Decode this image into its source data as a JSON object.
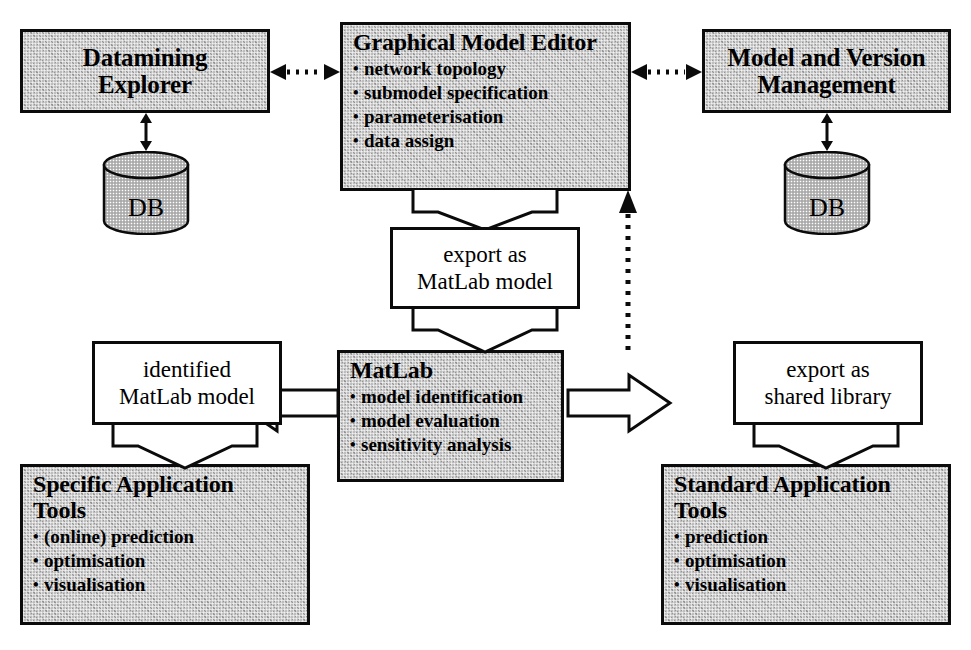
{
  "diagram": {
    "colors": {
      "box_fill": "#bdbdbd",
      "box_border": "#0b0b0b",
      "label_fill": "#ffffff",
      "canvas": "#ffffff"
    },
    "nodes": {
      "datamining_explorer": {
        "title_line1": "Datamining",
        "title_line2": "Explorer"
      },
      "graphical_model_editor": {
        "title": "Graphical Model Editor",
        "bullets": [
          "network topology",
          "submodel specification",
          "parameterisation",
          "data assign"
        ]
      },
      "model_and_version_management": {
        "title_line1": "Model and Version",
        "title_line2": "Management"
      },
      "db_left": {
        "label": "DB"
      },
      "db_right": {
        "label": "DB"
      },
      "export_matlab": {
        "line1": "export as",
        "line2": "MatLab model"
      },
      "matlab": {
        "title": "MatLab",
        "bullets": [
          "model identification",
          "model evaluation",
          "sensitivity analysis"
        ]
      },
      "identified_matlab_model": {
        "line1": "identified",
        "line2": "MatLab model"
      },
      "export_shared_library": {
        "line1": "export as",
        "line2": "shared library"
      },
      "specific_application_tools": {
        "title_line1": "Specific Application",
        "title_line2": "Tools",
        "bullets": [
          "(online) prediction",
          "optimisation",
          "visualisation"
        ]
      },
      "standard_application_tools": {
        "title_line1": "Standard Application",
        "title_line2": "Tools",
        "bullets": [
          "prediction",
          "optimisation",
          "visualisation"
        ]
      }
    },
    "connectors": [
      {
        "name": "explorer-editor-link",
        "style": "dotted",
        "heads": "both"
      },
      {
        "name": "editor-management-link",
        "style": "dotted",
        "heads": "both"
      },
      {
        "name": "explorer-db-link",
        "style": "solid",
        "heads": "both"
      },
      {
        "name": "management-db-link",
        "style": "solid",
        "heads": "both"
      },
      {
        "name": "matlab-editor-feedback",
        "style": "dotted",
        "heads": "up"
      },
      {
        "name": "editor-export-flow",
        "style": "block-arrow",
        "heads": "down"
      },
      {
        "name": "export-matlab-flow",
        "style": "block-arrow",
        "heads": "down"
      },
      {
        "name": "matlab-identified-flow",
        "style": "open-arrow",
        "heads": "left"
      },
      {
        "name": "matlab-sharedlib-flow",
        "style": "open-arrow",
        "heads": "right"
      },
      {
        "name": "identified-specific-flow",
        "style": "block-arrow",
        "heads": "down"
      },
      {
        "name": "sharedlib-standard-flow",
        "style": "block-arrow",
        "heads": "down"
      }
    ]
  }
}
